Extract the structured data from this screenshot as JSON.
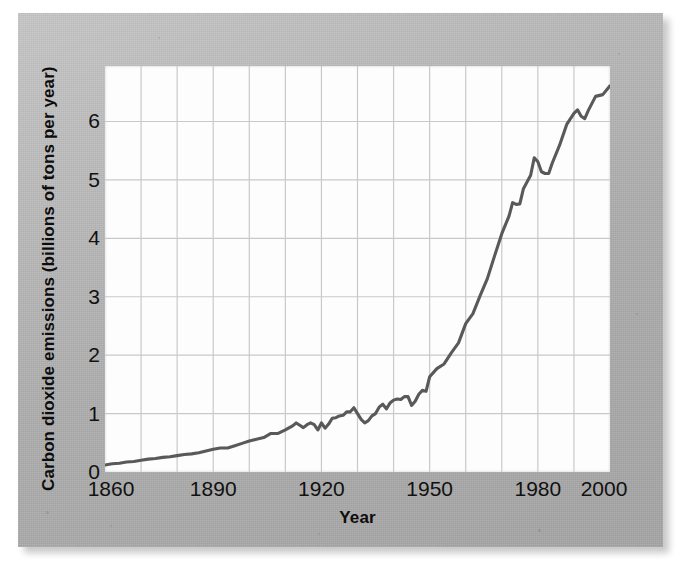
{
  "figure": {
    "background_color": "#b9b9b9",
    "panel_color": "#fdfdfd",
    "line_color": "#595959",
    "grid_color": "#c9c9c9",
    "text_color": "#111111"
  },
  "axes": {
    "x_title": "Year",
    "y_title": "Carbon dioxide emissions (billions of tons per year)",
    "x_tick_labels": [
      "1860",
      "1890",
      "1920",
      "1950",
      "1980",
      "2000"
    ],
    "x_tick_values": [
      1860,
      1890,
      1920,
      1950,
      1980,
      2000
    ],
    "y_tick_labels": [
      "0",
      "1",
      "2",
      "3",
      "4",
      "5",
      "6"
    ],
    "y_tick_values": [
      0,
      1,
      2,
      3,
      4,
      5,
      6
    ]
  },
  "chart_data": {
    "type": "line",
    "title": "",
    "subtitle": "",
    "xlabel": "Year",
    "ylabel": "Carbon dioxide emissions (billions of tons per year)",
    "xlim": [
      1860,
      2000
    ],
    "ylim": [
      0,
      6.95
    ],
    "grid": true,
    "grid_x_step": 10,
    "grid_y_step": 1,
    "legend": "none",
    "series": [
      {
        "name": "Carbon dioxide emissions",
        "color": "#595959",
        "x": [
          1860,
          1862,
          1864,
          1866,
          1868,
          1870,
          1872,
          1874,
          1876,
          1878,
          1880,
          1882,
          1884,
          1886,
          1888,
          1890,
          1892,
          1894,
          1896,
          1898,
          1900,
          1902,
          1904,
          1906,
          1908,
          1910,
          1912,
          1913,
          1914,
          1915,
          1916,
          1917,
          1918,
          1919,
          1920,
          1921,
          1922,
          1923,
          1924,
          1925,
          1926,
          1927,
          1928,
          1929,
          1930,
          1931,
          1932,
          1933,
          1934,
          1935,
          1936,
          1937,
          1938,
          1939,
          1940,
          1941,
          1942,
          1943,
          1944,
          1945,
          1946,
          1947,
          1948,
          1949,
          1950,
          1952,
          1954,
          1956,
          1958,
          1960,
          1962,
          1964,
          1966,
          1968,
          1970,
          1972,
          1973,
          1974,
          1975,
          1976,
          1978,
          1979,
          1980,
          1981,
          1982,
          1983,
          1984,
          1986,
          1988,
          1990,
          1991,
          1992,
          1993,
          1994,
          1996,
          1998,
          2000
        ],
        "y": [
          0.12,
          0.14,
          0.15,
          0.17,
          0.18,
          0.2,
          0.22,
          0.23,
          0.25,
          0.26,
          0.28,
          0.3,
          0.31,
          0.33,
          0.36,
          0.39,
          0.41,
          0.41,
          0.45,
          0.49,
          0.53,
          0.56,
          0.59,
          0.66,
          0.66,
          0.72,
          0.79,
          0.84,
          0.8,
          0.76,
          0.81,
          0.84,
          0.81,
          0.72,
          0.84,
          0.75,
          0.82,
          0.92,
          0.93,
          0.96,
          0.97,
          1.03,
          1.03,
          1.1,
          1.0,
          0.9,
          0.84,
          0.88,
          0.96,
          1.0,
          1.11,
          1.16,
          1.08,
          1.18,
          1.23,
          1.25,
          1.24,
          1.29,
          1.29,
          1.14,
          1.21,
          1.33,
          1.4,
          1.38,
          1.63,
          1.77,
          1.85,
          2.04,
          2.21,
          2.54,
          2.71,
          3.02,
          3.31,
          3.7,
          4.08,
          4.38,
          4.61,
          4.58,
          4.59,
          4.85,
          5.08,
          5.38,
          5.31,
          5.14,
          5.11,
          5.11,
          5.29,
          5.59,
          5.95,
          6.14,
          6.2,
          6.09,
          6.05,
          6.19,
          6.43,
          6.46,
          6.61
        ]
      }
    ],
    "annotations": [
      {
        "label": "World War I decline",
        "x": 1918
      },
      {
        "label": "Great Depression decline",
        "x": 1932
      },
      {
        "label": "World War II end decline",
        "x": 1945
      },
      {
        "label": "Oil crisis plateau",
        "x": 1982
      },
      {
        "label": "Early 1990s decline",
        "x": 1993
      }
    ]
  }
}
